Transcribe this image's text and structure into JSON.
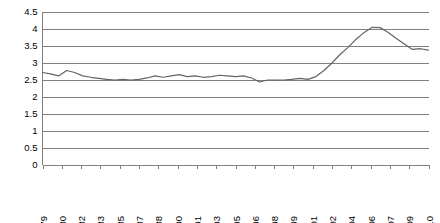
{
  "chart_data": {
    "type": "line",
    "title": "",
    "subtitle": "",
    "xlabel": "",
    "ylabel": "",
    "ylim": [
      0,
      4.5
    ],
    "ytick_labels": [
      "0",
      "0.5",
      "1",
      "1.5",
      "2",
      "2.5",
      "3",
      "3.5",
      "4",
      "4.5"
    ],
    "ytick_values": [
      0,
      0.5,
      1,
      1.5,
      2,
      2.5,
      3,
      3.5,
      4,
      4.5
    ],
    "grid": true,
    "legend": "none",
    "legend_position": "none",
    "xtick_labels": [
      "Mar-79",
      "Oct-80",
      "May-82",
      "Dec-83",
      "Jul-85",
      "Feb-87",
      "Sep-88",
      "Apr-90",
      "Nov-91",
      "Jun-93",
      "Jan-95",
      "Aug-96",
      "Mar-98",
      "Oct-99",
      "May-01",
      "Dec-02",
      "Jul-04",
      "Feb-06",
      "Sep-07",
      "Apr-09",
      "Nov-10"
    ],
    "xtick_label_rotation": 90,
    "xtick_interval_months": 20,
    "series": [
      {
        "name": "series-1",
        "color": "#646464",
        "x": [
          "Mar-79",
          "Nov-79",
          "Jul-80",
          "Mar-81",
          "Nov-81",
          "Jul-82",
          "Mar-83",
          "Nov-83",
          "Jul-84",
          "Mar-85",
          "Nov-85",
          "Jul-86",
          "Mar-87",
          "Nov-87",
          "Jul-88",
          "Mar-89",
          "Nov-89",
          "Jul-90",
          "Mar-91",
          "Nov-91",
          "Jul-92",
          "Mar-93",
          "Nov-93",
          "Jul-94",
          "Mar-95",
          "Nov-95",
          "Jul-96",
          "Mar-97",
          "Nov-97",
          "Jul-98",
          "Mar-99",
          "Nov-99",
          "Jul-00",
          "Mar-01",
          "Nov-01",
          "Jul-02",
          "Mar-03",
          "Nov-03",
          "Jul-04",
          "Mar-05",
          "Nov-05",
          "Jul-06",
          "Mar-07",
          "Nov-07",
          "Jul-08",
          "Mar-09",
          "Nov-09",
          "Jul-10",
          "Nov-10"
        ],
        "values": [
          2.72,
          2.68,
          2.62,
          2.78,
          2.72,
          2.62,
          2.58,
          2.55,
          2.52,
          2.5,
          2.52,
          2.5,
          2.52,
          2.56,
          2.62,
          2.58,
          2.62,
          2.66,
          2.6,
          2.62,
          2.58,
          2.6,
          2.64,
          2.62,
          2.6,
          2.62,
          2.56,
          2.44,
          2.5,
          2.5,
          2.5,
          2.52,
          2.55,
          2.52,
          2.6,
          2.78,
          3.0,
          3.25,
          3.46,
          3.7,
          3.9,
          4.05,
          4.04,
          3.9,
          3.72,
          3.56,
          3.4,
          3.42,
          3.38
        ]
      }
    ]
  }
}
